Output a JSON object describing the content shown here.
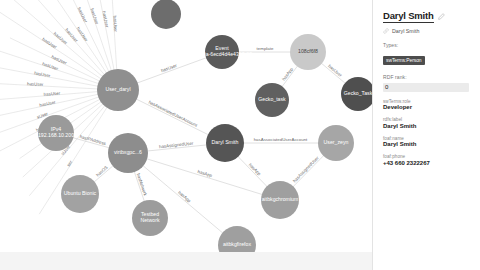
{
  "sidebar": {
    "title": "Daryl Smith",
    "edit_icon": "pencil-icon",
    "link_icon": "link-icon",
    "subtitle": "Daryl Smith",
    "types_label": "Types:",
    "type_badge": "swTerms:Person",
    "rdf_rank_label": "RDF rank:",
    "rdf_rank_value": "0",
    "properties": [
      {
        "key": "swTerms:role",
        "value": "Developer"
      },
      {
        "key": "rdfs:label",
        "value": "Daryl Smith"
      },
      {
        "key": "foaf:name",
        "value": "Daryl Smith"
      },
      {
        "key": "foaf:phone",
        "value": "+43 660 2322267"
      }
    ]
  },
  "graph": {
    "nodes": [
      {
        "id": "user_daryl",
        "label": "User_daryl",
        "x": 118,
        "y": 90,
        "r": 21,
        "color": "#8f8f8f",
        "text": "light"
      },
      {
        "id": "event",
        "label": "Event_0C1f60a-6ecd4d4e4313-03..",
        "x": 222,
        "y": 52,
        "r": 17,
        "color": "#5a5a5a",
        "text": "light"
      },
      {
        "id": "tmpl",
        "label": "108cf6f8",
        "x": 308,
        "y": 52,
        "r": 18,
        "color": "#c9c9c9",
        "text": "dark"
      },
      {
        "id": "gecko1",
        "label": "Gecko_task",
        "x": 272,
        "y": 100,
        "r": 17,
        "color": "#606060",
        "text": "light"
      },
      {
        "id": "gecko2",
        "label": "Gecko_Task",
        "x": 358,
        "y": 94,
        "r": 17,
        "color": "#4f4f4f",
        "text": "light"
      },
      {
        "id": "topnode",
        "label": "",
        "x": 166,
        "y": 14,
        "r": 15,
        "color": "#6d6d6d",
        "text": "light"
      },
      {
        "id": "ipv4",
        "label": "IPv4_192.168.10.200",
        "x": 56,
        "y": 133,
        "r": 18,
        "color": "#9a9a9a",
        "text": "light"
      },
      {
        "id": "vbox",
        "label": "virtbxgpc...6",
        "x": 128,
        "y": 153,
        "r": 20,
        "color": "#8d8d8d",
        "text": "light"
      },
      {
        "id": "ubuntu",
        "label": "Ubuntu Bionic",
        "x": 80,
        "y": 194,
        "r": 19,
        "color": "#a2a2a2",
        "text": "light"
      },
      {
        "id": "testbed",
        "label": "Testbed Network",
        "x": 150,
        "y": 218,
        "r": 18,
        "color": "#9c9c9c",
        "text": "light"
      },
      {
        "id": "daryl_smith",
        "label": "Daryl Smith",
        "x": 225,
        "y": 143,
        "r": 19,
        "color": "#555555",
        "text": "light"
      },
      {
        "id": "user_zeyn",
        "label": "User_zeyn",
        "x": 336,
        "y": 143,
        "r": 18,
        "color": "#a6a6a6",
        "text": "light"
      },
      {
        "id": "chromium",
        "label": "aitbkgchromium",
        "x": 280,
        "y": 200,
        "r": 19,
        "color": "#9f9f9f",
        "text": "light"
      },
      {
        "id": "firefox",
        "label": "aitbkgfirefox",
        "x": 237,
        "y": 245,
        "r": 19,
        "color": "#9f9f9f",
        "text": "light"
      }
    ],
    "edges": [
      {
        "from": "user_daryl",
        "to": "event",
        "label": "hasUser"
      },
      {
        "from": "event",
        "to": "tmpl",
        "label": "template"
      },
      {
        "from": "tmpl",
        "to": "gecko1",
        "label": "hasApp"
      },
      {
        "from": "tmpl",
        "to": "gecko2",
        "label": "hasUser"
      },
      {
        "from": "user_daryl",
        "to": "daryl_smith",
        "label": "hasAssociatedUserAccount"
      },
      {
        "from": "daryl_smith",
        "to": "user_zeyn",
        "label": "hasAssociatedUserAccount"
      },
      {
        "from": "vbox",
        "to": "ipv4",
        "label": "hasIPAddress"
      },
      {
        "from": "vbox",
        "to": "ubuntu",
        "label": "hasOS"
      },
      {
        "from": "vbox",
        "to": "testbed",
        "label": "hasNetwork"
      },
      {
        "from": "vbox",
        "to": "daryl_smith",
        "label": "hasAssignedUser"
      },
      {
        "from": "vbox",
        "to": "chromium",
        "label": "hasApp"
      },
      {
        "from": "vbox",
        "to": "firefox",
        "label": "hasApp"
      },
      {
        "from": "daryl_smith",
        "to": "chromium",
        "label": "hasApp"
      },
      {
        "from": "user_zeyn",
        "to": "chromium",
        "label": "hasAssignedUser"
      }
    ],
    "spoke_labels": [
      "hasUser",
      "hasUser",
      "hasUser",
      "hasUser",
      "hasUser",
      "hasUser",
      "hasUser",
      "hasUser",
      "hasUser",
      "hasUser",
      "hasUser",
      "hasUser",
      "hasUser",
      "hasUser",
      "sUser",
      "hasUser",
      "User",
      "ser",
      "sUser",
      "ser"
    ]
  }
}
